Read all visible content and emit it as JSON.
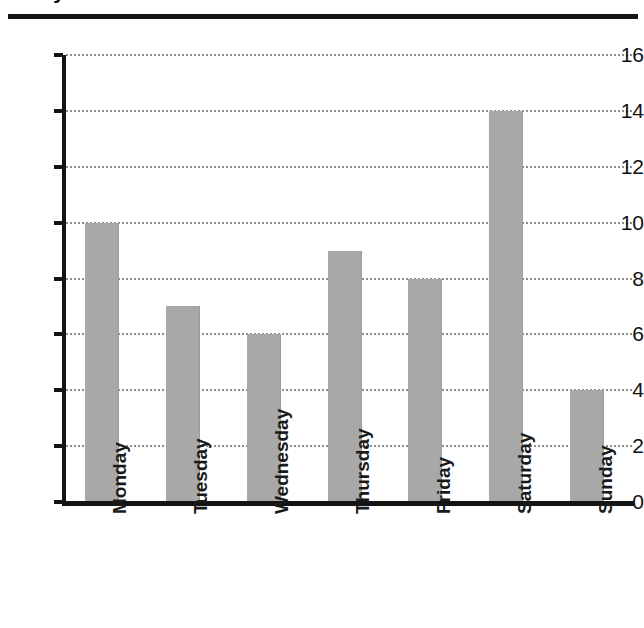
{
  "header": {
    "title_fragment": "Daily Visitor Count",
    "rule": "horizontal-rule"
  },
  "chart_data": {
    "type": "bar",
    "title": "Daily Visitor Count",
    "xlabel": "",
    "ylabel": "",
    "categories": [
      "Monday",
      "Tuesday",
      "Wednesday",
      "Thursday",
      "Friday",
      "Saturday",
      "Sunday"
    ],
    "values": [
      10,
      7,
      6,
      9,
      8,
      14,
      4
    ],
    "ylim": [
      0,
      16
    ],
    "ytick_labels": [
      "0",
      "2",
      "4",
      "6",
      "8",
      "10",
      "12",
      "14",
      "16"
    ],
    "ytick_values": [
      0,
      2,
      4,
      6,
      8,
      10,
      12,
      14,
      16
    ],
    "grid": true,
    "grid_style": "dotted",
    "legend": "none",
    "bar_color": "#a8a8a8",
    "axis_color": "#141414",
    "gridline_color": "#8d8d8d",
    "xtick_rotation": 90
  }
}
